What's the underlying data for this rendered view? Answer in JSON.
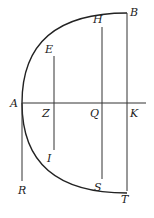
{
  "diagram": {
    "type": "parabola-geometric-figure",
    "labels": {
      "A": "A",
      "B": "B",
      "E": "E",
      "H": "H",
      "Z": "Z",
      "Q": "Q",
      "K": "K",
      "I": "I",
      "S": "S",
      "T": "T",
      "R": "R"
    },
    "colors": {
      "stroke": "#222222",
      "background": "#ffffff"
    }
  }
}
